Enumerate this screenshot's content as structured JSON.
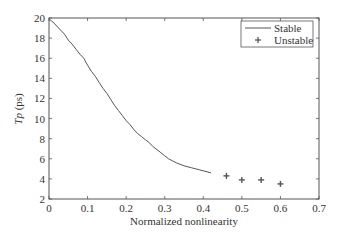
{
  "chart_data": {
    "type": "line",
    "title": "",
    "xlabel": "Normalized nonlinearity",
    "ylabel_italic": "Tp",
    "ylabel_unit": " (ps)",
    "xlim": [
      0,
      0.7
    ],
    "ylim": [
      2,
      20
    ],
    "xticks": [
      0,
      0.1,
      0.2,
      0.3,
      0.4,
      0.5,
      0.6,
      0.7
    ],
    "xtick_labels": [
      "0",
      "0.1",
      "0.2",
      "0.3",
      "0.4",
      "0.5",
      "0.6",
      "0.7"
    ],
    "yticks": [
      2,
      4,
      6,
      8,
      10,
      12,
      14,
      16,
      18,
      20
    ],
    "ytick_labels": [
      "2",
      "4",
      "6",
      "8",
      "10",
      "12",
      "14",
      "16",
      "18",
      "20"
    ],
    "grid": false,
    "legend_position": "upper right",
    "series": [
      {
        "name": "Stable",
        "style": "line",
        "color": "#555555",
        "x": [
          0.0,
          0.01,
          0.02,
          0.03,
          0.04,
          0.05,
          0.06,
          0.07,
          0.08,
          0.09,
          0.1,
          0.11,
          0.12,
          0.13,
          0.14,
          0.15,
          0.16,
          0.17,
          0.18,
          0.19,
          0.2,
          0.21,
          0.22,
          0.23,
          0.24,
          0.25,
          0.26,
          0.27,
          0.28,
          0.29,
          0.3,
          0.31,
          0.32,
          0.33,
          0.35,
          0.37,
          0.39,
          0.41,
          0.42
        ],
        "y": [
          19.9,
          19.6,
          19.2,
          18.8,
          18.4,
          17.8,
          17.4,
          16.9,
          16.4,
          16.0,
          15.3,
          14.7,
          14.2,
          13.6,
          13.0,
          12.5,
          11.9,
          11.3,
          10.8,
          10.3,
          9.8,
          9.4,
          8.9,
          8.5,
          8.2,
          7.9,
          7.6,
          7.2,
          6.9,
          6.6,
          6.3,
          6.0,
          5.8,
          5.6,
          5.3,
          5.1,
          4.9,
          4.7,
          4.6
        ]
      },
      {
        "name": "Unstable",
        "style": "marker",
        "marker": "+",
        "color": "#555555",
        "x": [
          0.46,
          0.5,
          0.55,
          0.6
        ],
        "y": [
          4.3,
          3.9,
          3.9,
          3.5
        ]
      }
    ]
  },
  "legend": {
    "stable_label": "Stable",
    "unstable_label": "Unstable"
  }
}
